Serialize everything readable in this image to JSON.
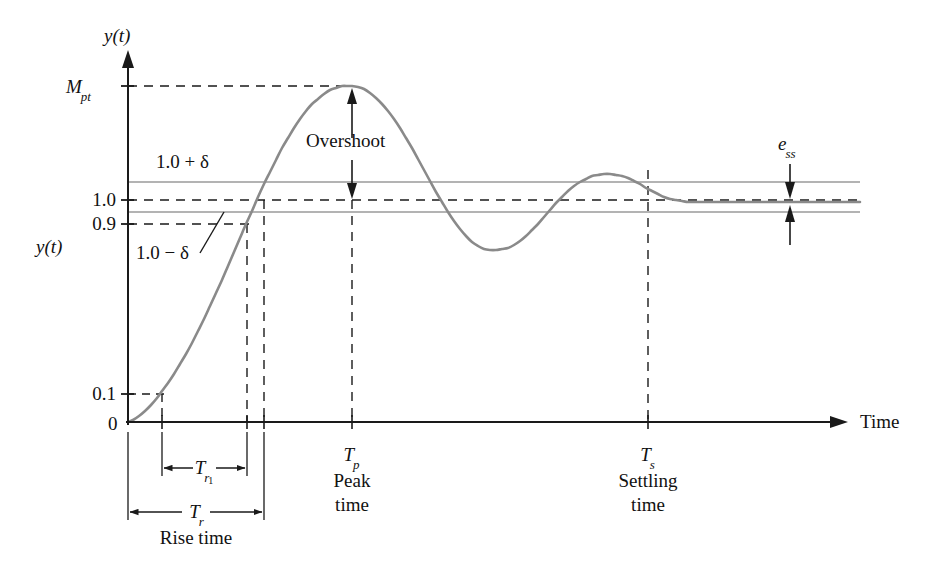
{
  "figure": {
    "axis": {
      "y_label_top": "y(t)",
      "y_label_side": "y(t)",
      "x_label": "Time",
      "origin_label": "0"
    },
    "y_ticks": [
      {
        "id": "mpt",
        "text": "M",
        "sub": "pt",
        "y": 86
      },
      {
        "id": "one",
        "text": "1.0",
        "sub": "",
        "y": 200
      },
      {
        "id": "ninetenths",
        "text": "0.9",
        "sub": "",
        "y": 224
      },
      {
        "id": "onetenth",
        "text": "0.1",
        "sub": "",
        "y": 394
      }
    ],
    "band_labels": {
      "upper": "1.0 + δ",
      "lower": "1.0 − δ"
    },
    "annotations": {
      "overshoot": "Overshoot",
      "ess_base": "e",
      "ess_sub": "ss"
    },
    "time_markers": [
      {
        "id": "tp",
        "symbol": "T",
        "sub": "p",
        "caption_line1": "Peak",
        "caption_line2": "time",
        "x": 352
      },
      {
        "id": "ts",
        "symbol": "T",
        "sub": "s",
        "caption_line1": "Settling",
        "caption_line2": "time",
        "x": 648
      }
    ],
    "dimensions": [
      {
        "id": "tr1",
        "symbol": "T",
        "sub": "r",
        "subsub": "1",
        "caption": "",
        "x_start": 162,
        "x_end": 247,
        "y": 468
      },
      {
        "id": "tr",
        "symbol": "T",
        "sub": "r",
        "subsub": "",
        "caption": "Rise time",
        "x_start": 128,
        "x_end": 264,
        "y": 512
      }
    ],
    "colors": {
      "curve": "#8a8a8a",
      "band": "#9a9a9a",
      "axis": "#1a1a1a",
      "dashed": "#1a1a1a",
      "text": "#111111",
      "background": "#ffffff"
    }
  },
  "chart_data": {
    "type": "line",
    "xlabel": "Time",
    "ylabel": "y(t)",
    "grid": false,
    "legend": null,
    "xlim": [
      0,
      1
    ],
    "ylim": [
      0,
      1.42
    ],
    "reference_lines": [
      {
        "name": "1.0 + δ",
        "value": 1.055,
        "style": "solid-thin",
        "color": "#9a9a9a"
      },
      {
        "name": "1.0",
        "value": 1.0,
        "style": "dashed",
        "color": "#1a1a1a"
      },
      {
        "name": "1.0 − δ",
        "value": 0.945,
        "style": "solid-thin",
        "color": "#9a9a9a"
      },
      {
        "name": "0.9",
        "value": 0.9,
        "style": "dashed",
        "color": "#1a1a1a"
      },
      {
        "name": "0.1",
        "value": 0.1,
        "style": "dashed",
        "color": "#1a1a1a"
      },
      {
        "name": "M_pt",
        "value": 1.42,
        "style": "dashed",
        "color": "#1a1a1a"
      }
    ],
    "markers": {
      "T_r1_start_value": 0.1,
      "T_r1_end_value": 0.9,
      "T_r_end_value": 1.0,
      "T_p_value": 1.42,
      "T_s_value": 1.06,
      "steady_state_value": 0.985,
      "e_ss_description": "steady-state error between final value and 1.0"
    },
    "series": [
      {
        "name": "y(t) step response",
        "color": "#8a8a8a",
        "points": [
          [
            128,
            422
          ],
          [
            133,
            420
          ],
          [
            139,
            416
          ],
          [
            145,
            411
          ],
          [
            151,
            405
          ],
          [
            157,
            398
          ],
          [
            162,
            391
          ],
          [
            168,
            383
          ],
          [
            174,
            374
          ],
          [
            180,
            364
          ],
          [
            186,
            354
          ],
          [
            192,
            343
          ],
          [
            198,
            331
          ],
          [
            204,
            319
          ],
          [
            210,
            306
          ],
          [
            216,
            293
          ],
          [
            222,
            280
          ],
          [
            228,
            266
          ],
          [
            234,
            252
          ],
          [
            240,
            238
          ],
          [
            246,
            224
          ],
          [
            252,
            211
          ],
          [
            258,
            197
          ],
          [
            264,
            184
          ],
          [
            270,
            172
          ],
          [
            276,
            160
          ],
          [
            282,
            148
          ],
          [
            288,
            138
          ],
          [
            294,
            128
          ],
          [
            300,
            119
          ],
          [
            306,
            111
          ],
          [
            312,
            104
          ],
          [
            318,
            99
          ],
          [
            324,
            94
          ],
          [
            330,
            90
          ],
          [
            336,
            88
          ],
          [
            342,
            86
          ],
          [
            348,
            86
          ],
          [
            352,
            86
          ],
          [
            358,
            87
          ],
          [
            364,
            89
          ],
          [
            370,
            93
          ],
          [
            376,
            98
          ],
          [
            382,
            104
          ],
          [
            388,
            111
          ],
          [
            394,
            119
          ],
          [
            400,
            128
          ],
          [
            406,
            138
          ],
          [
            412,
            148
          ],
          [
            418,
            159
          ],
          [
            424,
            170
          ],
          [
            430,
            181
          ],
          [
            436,
            192
          ],
          [
            442,
            202
          ],
          [
            448,
            212
          ],
          [
            454,
            221
          ],
          [
            460,
            229
          ],
          [
            466,
            236
          ],
          [
            472,
            242
          ],
          [
            478,
            246
          ],
          [
            484,
            249
          ],
          [
            490,
            250
          ],
          [
            496,
            250
          ],
          [
            502,
            249
          ],
          [
            508,
            248
          ],
          [
            514,
            245
          ],
          [
            520,
            241
          ],
          [
            526,
            236
          ],
          [
            532,
            230
          ],
          [
            538,
            224
          ],
          [
            544,
            217
          ],
          [
            550,
            210
          ],
          [
            556,
            203
          ],
          [
            562,
            197
          ],
          [
            568,
            191
          ],
          [
            574,
            186
          ],
          [
            580,
            182
          ],
          [
            586,
            179
          ],
          [
            592,
            176
          ],
          [
            598,
            175
          ],
          [
            604,
            174
          ],
          [
            610,
            174
          ],
          [
            616,
            175
          ],
          [
            622,
            176
          ],
          [
            628,
            178
          ],
          [
            634,
            181
          ],
          [
            640,
            184
          ],
          [
            646,
            188
          ],
          [
            652,
            191
          ],
          [
            658,
            194
          ],
          [
            664,
            197
          ],
          [
            670,
            199
          ],
          [
            676,
            200
          ],
          [
            682,
            201
          ],
          [
            688,
            202
          ],
          [
            694,
            202
          ],
          [
            700,
            202
          ],
          [
            710,
            202
          ],
          [
            730,
            202
          ],
          [
            760,
            202
          ],
          [
            800,
            202
          ],
          [
            830,
            202
          ],
          [
            860,
            202
          ]
        ]
      }
    ]
  },
  "geometry": {
    "plot": {
      "axis_x": 128,
      "axis_y_top": 52,
      "baseline_y": 422,
      "x_axis_end": 845,
      "line_right_end": 860
    },
    "levels": {
      "mpt": 86,
      "band_upper": 182,
      "one": 200,
      "band_lower": 212,
      "steady": 202,
      "nine": 224,
      "onetenth": 394
    },
    "verticals": {
      "t_01": 162,
      "t_09": 247,
      "t_10": 264,
      "t_p": 352,
      "t_s": 648
    }
  }
}
